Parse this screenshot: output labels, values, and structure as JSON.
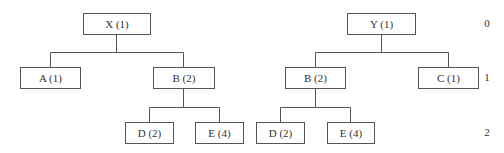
{
  "trees": [
    {
      "name": "left-tree",
      "nodes": {
        "root": {
          "label": "X (1)"
        },
        "a": {
          "label": "A (1)"
        },
        "b": {
          "label": "B (2)"
        },
        "d": {
          "label": "D (2)"
        },
        "e": {
          "label": "E (4)"
        }
      }
    },
    {
      "name": "right-tree",
      "nodes": {
        "root": {
          "label": "Y (1)"
        },
        "b": {
          "label": "B (2)"
        },
        "c": {
          "label": "C (1)"
        },
        "d": {
          "label": "D (2)"
        },
        "e": {
          "label": "E (4)"
        }
      }
    }
  ],
  "levels": [
    "0",
    "1",
    "2"
  ],
  "colors": {
    "line": "#555555",
    "text": "#333333",
    "background": "#ffffff"
  }
}
